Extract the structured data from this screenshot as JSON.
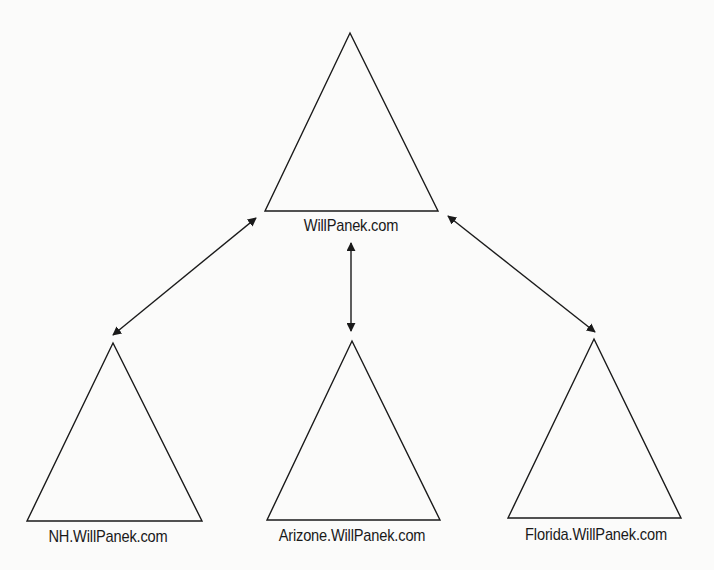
{
  "diagram": {
    "type": "domain-tree-hierarchy",
    "colors": {
      "background": "#fbfbfa",
      "stroke": "#1a1a1a",
      "text": "#1a1a1a"
    },
    "root": {
      "label": "WillPanek.com",
      "shape": "triangle"
    },
    "children": [
      {
        "label": "NH.WillPanek.com",
        "shape": "triangle"
      },
      {
        "label": "Arizone.WillPanek.com",
        "shape": "triangle"
      },
      {
        "label": "Florida.WillPanek.com",
        "shape": "triangle"
      }
    ],
    "connections": [
      {
        "from": "WillPanek.com",
        "to": "NH.WillPanek.com",
        "style": "double-arrow"
      },
      {
        "from": "WillPanek.com",
        "to": "Arizone.WillPanek.com",
        "style": "double-arrow"
      },
      {
        "from": "WillPanek.com",
        "to": "Florida.WillPanek.com",
        "style": "double-arrow"
      }
    ]
  }
}
